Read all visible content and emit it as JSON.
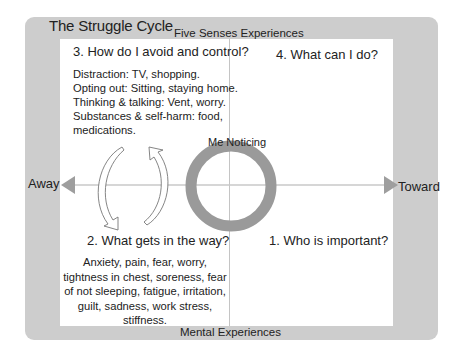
{
  "diagram": {
    "title": "The Struggle Cycle",
    "top_label": "Five Senses Experiences",
    "bottom_label": "Mental Experiences",
    "axis": {
      "left_label": "Away",
      "right_label": "Toward"
    },
    "center_label": "Me Noticing",
    "quadrants": {
      "top_left": {
        "title": "3. How do I avoid and control?",
        "items": [
          "Distraction:  TV, shopping.",
          "Opting out:  Sitting, staying home.",
          "Thinking & talking:  Vent, worry.",
          "Substances & self-harm:  food,",
          "medications."
        ]
      },
      "top_right": {
        "title": "4. What can I do?"
      },
      "bottom_left": {
        "title": "2. What gets in the way?",
        "text": "Anxiety, pain, fear, worry, tightness in chest, soreness, fear of not sleeping, fatigue, irritation, guilt, sadness, work stress, stiffness."
      },
      "bottom_right": {
        "title": "1. Who is important?"
      }
    },
    "icons": {
      "cycle_arrows": "circular-cycle-arrows",
      "center": "ring",
      "left_arrow": "triangle-left",
      "right_arrow": "triangle-right"
    },
    "colors": {
      "panel": "#cdcdcd",
      "ring": "#9a9a9a",
      "axis": "#c8c8c8",
      "arrowhead": "#9e9e9e"
    }
  }
}
